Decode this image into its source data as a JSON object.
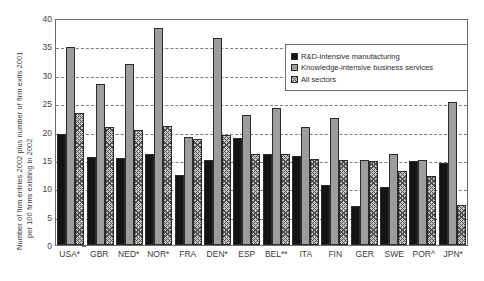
{
  "chart_data": {
    "type": "bar",
    "title": "",
    "xlabel": "",
    "ylabel": "Number of firm entries 2002 plus number of firm exits 2001 per 100 firms existing in 2002",
    "ylabel_line1": "Number of firm entries 2002 plus number of firm exits 2001",
    "ylabel_line2": "per 100 firms existing in 2002",
    "ylim": [
      0,
      40
    ],
    "yticks": [
      0,
      5,
      10,
      15,
      20,
      25,
      30,
      35,
      40
    ],
    "grid": "horizontal-dashed",
    "legend_position": "top-right-inside",
    "categories": [
      "USA*",
      "GBR",
      "NED*",
      "NOR*",
      "FRA",
      "DEN*",
      "ESP",
      "BEL**",
      "ITA",
      "FIN",
      "GER",
      "SWE",
      "POR^",
      "JPN*"
    ],
    "series": [
      {
        "name": "R&D-intensive manufacturing",
        "color": "#141414",
        "pattern": "solid",
        "values": [
          19.5,
          15.5,
          15.4,
          16.0,
          12.4,
          15.0,
          18.8,
          16.0,
          15.6,
          10.5,
          6.8,
          10.3,
          14.8,
          14.5
        ]
      },
      {
        "name": "Knowledge-intensive business services",
        "color": "#9d9d9d",
        "pattern": "solid-gray",
        "values": [
          34.9,
          28.4,
          31.9,
          38.2,
          19.1,
          36.4,
          22.9,
          24.1,
          20.8,
          22.3,
          15.0,
          16.0,
          14.9,
          25.2
        ]
      },
      {
        "name": "All sectors",
        "color": "#c9c9c9",
        "pattern": "crosshatch",
        "values": [
          23.2,
          20.8,
          20.3,
          21.0,
          18.7,
          19.4,
          16.1,
          16.0,
          15.2,
          15.0,
          14.8,
          13.0,
          12.1,
          7.0
        ]
      }
    ]
  },
  "legend": {
    "items": [
      {
        "label": "R&D-intensive manufacturing"
      },
      {
        "label": "Knowledge-intensive business services"
      },
      {
        "label": "All sectors"
      }
    ]
  },
  "footnote": ""
}
